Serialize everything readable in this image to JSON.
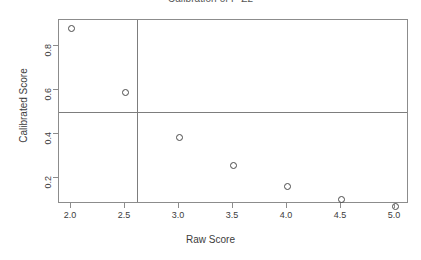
{
  "chart_data": {
    "type": "scatter",
    "title": "Calibration of P-Z2",
    "xlabel": "Raw Score",
    "ylabel": "Calibrated Score",
    "x": [
      2.0,
      2.5,
      3.0,
      3.5,
      4.0,
      4.5,
      5.0
    ],
    "values": [
      0.88,
      0.59,
      0.385,
      0.26,
      0.165,
      0.105,
      0.075
    ],
    "series": [
      {
        "name": "Calibrated Score",
        "values": [
          0.88,
          0.59,
          0.385,
          0.26,
          0.165,
          0.105,
          0.075
        ]
      }
    ],
    "points": [
      {
        "x": 2.0,
        "y": 0.88
      },
      {
        "x": 2.5,
        "y": 0.59
      },
      {
        "x": 3.0,
        "y": 0.385
      },
      {
        "x": 3.5,
        "y": 0.26
      },
      {
        "x": 4.0,
        "y": 0.165
      },
      {
        "x": 4.5,
        "y": 0.105
      },
      {
        "x": 5.0,
        "y": 0.075
      }
    ],
    "marker": "open-circle",
    "marker_color": "#4a4a4a",
    "xlim": [
      1.85,
      5.2
    ],
    "ylim": [
      0.03,
      0.94
    ],
    "xticks": [
      2.0,
      2.5,
      3.0,
      3.5,
      4.0,
      4.5,
      5.0
    ],
    "yticks": [
      0.2,
      0.4,
      0.6,
      0.8
    ],
    "xticklabels": [
      "2.0",
      "2.5",
      "3.0",
      "3.5",
      "4.0",
      "4.5",
      "5.0"
    ],
    "yticklabels": [
      "0.2",
      "0.4",
      "0.6",
      "0.8"
    ],
    "grid": false,
    "legend": false,
    "reference_lines": [
      {
        "orientation": "horizontal",
        "value": 0.5,
        "color": "#7d7d7d"
      },
      {
        "orientation": "vertical",
        "value": 2.61,
        "color": "#7d7d7d"
      }
    ],
    "frame_color": "#8c8c8c",
    "background": "#ffffff"
  }
}
